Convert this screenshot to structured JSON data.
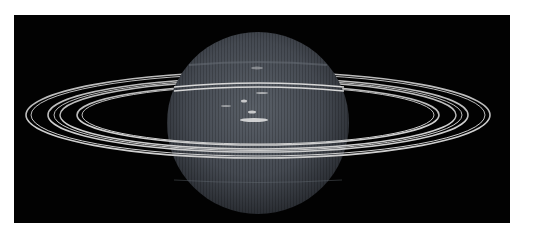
{
  "image": {
    "subject": "ringed-planet",
    "description": "Grayscale view of a blue-gray banded planet with multiple thin bright rings encircling it against black space",
    "colors": {
      "background": "#020202",
      "planet": "#4a4f57",
      "planet_highlight": "#6a7078",
      "rings": "#c8c8c8",
      "clouds": "#e8e8e8",
      "border": "#ffffff"
    }
  }
}
